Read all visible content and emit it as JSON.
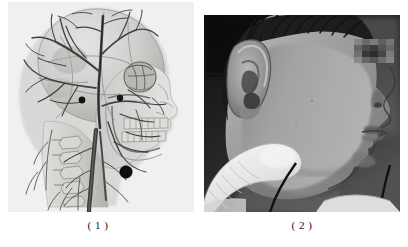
{
  "figure": {
    "background_color": "#ffffff",
    "panel_count": 2,
    "panels": [
      {
        "id": "panel-1",
        "caption": "( 1 )",
        "kind": "anatomical-illustration",
        "subject": "head-and-neck lateral view: skull with superficial vascular network",
        "orientation": "left profile, facing right",
        "rendering": "grayscale pencil/halftone drawing",
        "features": [
          "cranial vault with sutures",
          "superficial temporal and occipital vessel branches",
          "orbit and zygomatic arch",
          "maxillary and mandibular dentition",
          "mandible and angle of mandible",
          "cervical vertebrae",
          "common / internal jugular vessel trunk",
          "dark circular marker over angle of mandible",
          "two small dark circular markers near orbit and temporal region"
        ],
        "palette": {
          "bone_light": "#e9e8e6",
          "bone_mid": "#c9c8c5",
          "bone_shadow": "#a9a8a5",
          "vessel": "#4a4a4a",
          "vessel_dark": "#2b2b2b",
          "marker": "#131313"
        }
      },
      {
        "id": "panel-2",
        "caption": "( 2 )",
        "kind": "clinical-photograph",
        "subject": "patient head in profile with gloved finger palpating submandibular region",
        "orientation": "right profile, facing right",
        "rendering": "grayscale photograph",
        "features": [
          "short dark hair",
          "auricle / external ear",
          "cheek and jawline",
          "nose, lips and chin in profile",
          "pixelated censor block over eye region",
          "white gloved index fingertip pressing upward beneath mandible",
          "dark cord / tube below finger",
          "white collar at lower edge",
          "dark background at upper left"
        ],
        "palette": {
          "background_dark": "#1c1c1c",
          "hair": "#262626",
          "skin_light": "#c6c6c6",
          "skin_mid": "#9c9c9c",
          "skin_shadow": "#6f6f6f",
          "glove_white": "#f2f2f2",
          "collar_white": "#ededed",
          "censor_block": "#6a6a6a"
        }
      }
    ]
  }
}
